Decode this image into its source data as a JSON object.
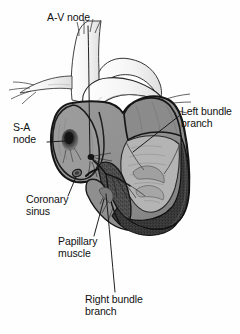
{
  "figure": {
    "type": "anatomical-illustration",
    "style": "grayscale line drawing with halftone shading",
    "background_color": "#fefefe",
    "outline_color": "#1a1a1a",
    "chamber_fill_color": "#909090",
    "myocardium_fill_color": "#4a4a4a",
    "vessel_fill_color": "#f7f7f7",
    "node_color": "#2b2b2b",
    "leader_line_color": "#1a1a1a"
  },
  "labels": {
    "av_node": "A-V node",
    "sa_node": "S-A\nnode",
    "left_bundle_branch": "Left bundle\nbranch",
    "coronary_sinus": "Coronary\nsinus",
    "papillary_muscle": "Papillary\nmuscle",
    "right_bundle_branch": "Right bundle\nbranch"
  },
  "leaders": {
    "av_node": {
      "from": [
        88,
        26
      ],
      "to": [
        90,
        156
      ]
    },
    "sa_node": {
      "from": [
        47,
        142
      ],
      "to": [
        66,
        141
      ]
    },
    "left_bundle_branch": {
      "from": [
        179,
        116
      ],
      "to": [
        133,
        152
      ]
    },
    "coronary_sinus": {
      "from": [
        68,
        196
      ],
      "to": [
        76,
        177
      ]
    },
    "papillary_muscle": {
      "from": [
        94,
        236
      ],
      "to": [
        103,
        200
      ]
    },
    "right_bundle_branch": {
      "from": [
        115,
        292
      ],
      "to": [
        106,
        193
      ]
    }
  },
  "structures": [
    "superior vena cava",
    "aorta",
    "pulmonary artery",
    "right atrium",
    "left atrium",
    "right ventricle",
    "left ventricle",
    "interventricular septum",
    "S-A node",
    "A-V node",
    "bundle of His",
    "left bundle branch",
    "right bundle branch",
    "coronary sinus",
    "papillary muscle"
  ]
}
